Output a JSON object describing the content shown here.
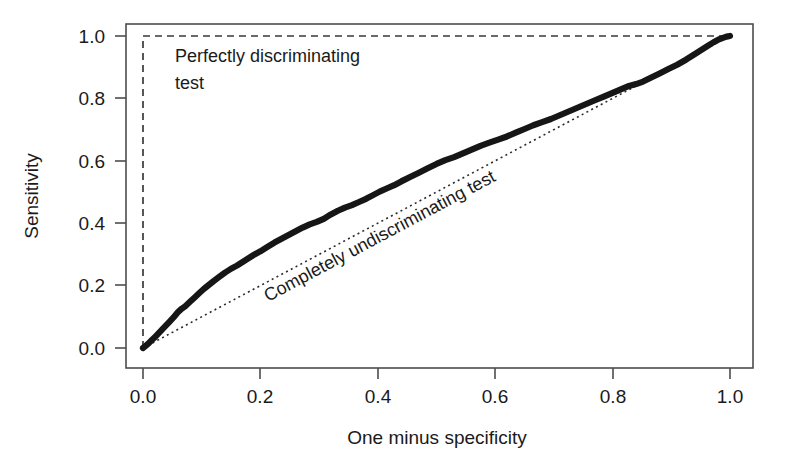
{
  "chart_data": {
    "type": "line",
    "title": "",
    "xlabel": "One minus specificity",
    "ylabel": "Sensitivity",
    "xlim": [
      -0.04,
      1.06
    ],
    "ylim": [
      -0.04,
      1.06
    ],
    "xticks": [
      "0.0",
      "0.2",
      "0.4",
      "0.6",
      "0.8",
      "1.0"
    ],
    "xtick_values": [
      0.0,
      0.2,
      0.4,
      0.6,
      0.8,
      1.0
    ],
    "yticks": [
      "0.0",
      "0.2",
      "0.4",
      "0.6",
      "0.8",
      "1.0"
    ],
    "ytick_values": [
      0.0,
      0.2,
      0.4,
      0.6,
      0.8,
      1.0
    ],
    "grid": false,
    "legend": "none",
    "series": [
      {
        "name": "ROC curve",
        "style": "solid-thick",
        "color": "#161616",
        "x": [
          0.0,
          0.004,
          0.009,
          0.014,
          0.02,
          0.026,
          0.032,
          0.038,
          0.045,
          0.052,
          0.06,
          0.066,
          0.072,
          0.08,
          0.088,
          0.096,
          0.104,
          0.112,
          0.12,
          0.13,
          0.14,
          0.15,
          0.16,
          0.17,
          0.18,
          0.19,
          0.2,
          0.212,
          0.224,
          0.236,
          0.248,
          0.26,
          0.272,
          0.284,
          0.296,
          0.308,
          0.32,
          0.332,
          0.344,
          0.356,
          0.368,
          0.38,
          0.392,
          0.404,
          0.416,
          0.428,
          0.44,
          0.455,
          0.47,
          0.485,
          0.5,
          0.515,
          0.53,
          0.545,
          0.56,
          0.575,
          0.59,
          0.605,
          0.62,
          0.635,
          0.65,
          0.665,
          0.68,
          0.695,
          0.71,
          0.725,
          0.74,
          0.755,
          0.77,
          0.785,
          0.8,
          0.815,
          0.828,
          0.84,
          0.852,
          0.865,
          0.88,
          0.895,
          0.91,
          0.925,
          0.94,
          0.952,
          0.962,
          0.972,
          0.98,
          0.988,
          0.994,
          1.0
        ],
        "y": [
          0.0,
          0.006,
          0.014,
          0.024,
          0.034,
          0.046,
          0.058,
          0.07,
          0.084,
          0.098,
          0.116,
          0.126,
          0.134,
          0.148,
          0.162,
          0.176,
          0.19,
          0.202,
          0.214,
          0.228,
          0.242,
          0.254,
          0.264,
          0.276,
          0.288,
          0.3,
          0.31,
          0.324,
          0.338,
          0.35,
          0.362,
          0.374,
          0.386,
          0.396,
          0.404,
          0.414,
          0.428,
          0.44,
          0.45,
          0.458,
          0.468,
          0.478,
          0.49,
          0.502,
          0.512,
          0.522,
          0.534,
          0.548,
          0.562,
          0.576,
          0.59,
          0.602,
          0.612,
          0.624,
          0.636,
          0.648,
          0.658,
          0.668,
          0.678,
          0.69,
          0.702,
          0.714,
          0.724,
          0.734,
          0.746,
          0.758,
          0.77,
          0.782,
          0.794,
          0.806,
          0.818,
          0.83,
          0.84,
          0.846,
          0.854,
          0.866,
          0.88,
          0.894,
          0.908,
          0.924,
          0.942,
          0.956,
          0.968,
          0.98,
          0.988,
          0.994,
          0.998,
          1.0
        ]
      },
      {
        "name": "Perfectly discriminating test",
        "style": "dashed",
        "color": "#3a3a3a",
        "x": [
          0.0,
          0.0,
          1.0
        ],
        "y": [
          0.0,
          1.0,
          1.0
        ]
      },
      {
        "name": "Completely undiscriminating test",
        "style": "dotted",
        "color": "#2b2b2b",
        "x": [
          0.0,
          1.0
        ],
        "y": [
          0.0,
          1.0
        ]
      }
    ],
    "annotations": [
      {
        "id": "perfect-test",
        "line1": "Perfectly discriminating",
        "line2": "test",
        "x": 0.045,
        "y": 0.93,
        "rotation": 0
      },
      {
        "id": "undiscriminating-test",
        "text": "Completely undiscriminating test",
        "x": 0.33,
        "y": 0.27,
        "rotation": -28
      }
    ]
  },
  "axes": {
    "x_title": "One minus specificity",
    "y_title": "Sensitivity",
    "x_tick_labels": [
      "0.0",
      "0.2",
      "0.4",
      "0.6",
      "0.8",
      "1.0"
    ],
    "y_tick_labels": [
      "0.0",
      "0.2",
      "0.4",
      "0.6",
      "0.8",
      "1.0"
    ]
  },
  "annotations": {
    "perfect_line1": "Perfectly discriminating",
    "perfect_line2": "test",
    "undiscriminating": "Completely undiscriminating test"
  },
  "colors": {
    "background": "#ffffff",
    "frame": "#4d4d4d",
    "roc_curve": "#161616",
    "perfect_line": "#3a3a3a",
    "diagonal_line": "#2b2b2b",
    "text": "#1a1a1a"
  }
}
